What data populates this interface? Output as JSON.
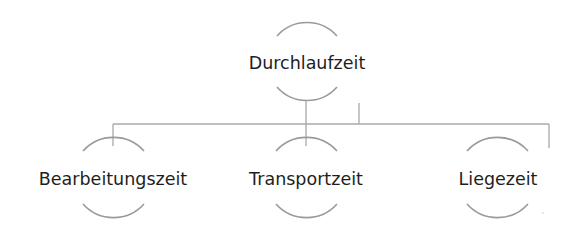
{
  "diagram": {
    "type": "hierarchy",
    "root": {
      "label": "Durchlaufzeit"
    },
    "children": [
      {
        "label": "Bearbeitungszeit"
      },
      {
        "label": "Transportzeit"
      },
      {
        "label": "Liegezeit"
      }
    ],
    "colors": {
      "text": "#1e1e1e",
      "arc": "#9a9a9a",
      "connector": "#a8a8a8",
      "background": "#ffffff"
    }
  }
}
